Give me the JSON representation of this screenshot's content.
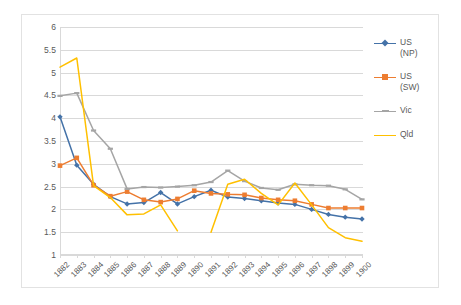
{
  "chart_data": {
    "type": "line",
    "title": "",
    "xlabel": "",
    "ylabel": "",
    "ylim": [
      1,
      6
    ],
    "ytick_step": 0.5,
    "yticks": [
      "6",
      "5.5",
      "5",
      "4.5",
      "4",
      "3.5",
      "3",
      "2.5",
      "2",
      "1.5",
      "1"
    ],
    "grid": true,
    "legend_position": "right",
    "categories": [
      "1882",
      "1883",
      "1884",
      "1885",
      "1886",
      "1887",
      "1888",
      "1889",
      "1890",
      "1891",
      "1892",
      "1893",
      "1894",
      "1895",
      "1896",
      "1897",
      "1898",
      "1899",
      "1900"
    ],
    "series": [
      {
        "name": "US (NP)",
        "label_lines": [
          "US",
          "(NP)"
        ],
        "color": "#4472a8",
        "marker": "diamond",
        "values": [
          4.03,
          2.97,
          2.55,
          2.28,
          2.12,
          2.15,
          2.37,
          2.12,
          2.28,
          2.42,
          2.27,
          2.24,
          2.19,
          2.14,
          2.11,
          2.0,
          1.89,
          1.83,
          1.79
        ]
      },
      {
        "name": "US (SW)",
        "label_lines": [
          "US",
          "(SW)"
        ],
        "color": "#ed7d31",
        "marker": "square",
        "values": [
          2.96,
          3.13,
          2.53,
          2.29,
          2.39,
          2.21,
          2.16,
          2.23,
          2.41,
          2.35,
          2.33,
          2.32,
          2.25,
          2.21,
          2.19,
          2.11,
          2.03,
          2.03,
          2.03
        ]
      },
      {
        "name": "Vic",
        "label_lines": [
          "Vic"
        ],
        "color": "#a5a5a5",
        "marker": "dash",
        "values": [
          4.49,
          4.55,
          3.73,
          3.33,
          2.45,
          2.49,
          2.48,
          2.5,
          2.53,
          2.6,
          2.85,
          2.62,
          2.47,
          2.43,
          2.55,
          2.53,
          2.52,
          2.44,
          2.22
        ]
      },
      {
        "name": "Qld",
        "label_lines": [
          "Qld"
        ],
        "color": "#ffc000",
        "marker": "none",
        "values": [
          5.12,
          5.32,
          2.52,
          2.26,
          1.88,
          1.9,
          2.1,
          1.53,
          null,
          1.5,
          2.55,
          2.66,
          2.35,
          2.1,
          2.58,
          2.1,
          1.6,
          1.38,
          1.3
        ]
      }
    ]
  },
  "legend": {
    "entries": [
      {
        "label": "US (NP)",
        "line1": "US",
        "line2": "(NP)"
      },
      {
        "label": "US (SW)",
        "line1": "US",
        "line2": "(SW)"
      },
      {
        "label": "Vic",
        "line1": "Vic",
        "line2": ""
      },
      {
        "label": "Qld",
        "line1": "Qld",
        "line2": ""
      }
    ]
  },
  "colors": {
    "series_blue": "#4472a8",
    "series_orange": "#ed7d31",
    "series_gray": "#a5a5a5",
    "series_yellow": "#ffc000",
    "gridline": "#d9d9d9",
    "axis_text": "#595959",
    "chart_border": "#e2e2e2",
    "background": "#ffffff"
  }
}
